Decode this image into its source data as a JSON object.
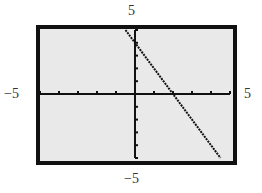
{
  "chart_data": {
    "type": "line",
    "title": "",
    "xlabel": "",
    "ylabel": "",
    "xlim": [
      -5,
      5
    ],
    "ylim": [
      -5,
      5
    ],
    "xscl": 1,
    "yscl": 1,
    "grid": false,
    "window_labels": {
      "ymax": "5",
      "ymin": "−5",
      "xmin": "−5",
      "xmax": "5"
    },
    "series": [
      {
        "name": "y = -2x + 4",
        "x": [
          -0.5,
          0,
          2,
          4.5
        ],
        "y": [
          5,
          4,
          0,
          -5
        ]
      }
    ],
    "x_intercept": 2,
    "y_intercept": 4
  },
  "colors": {
    "frame": "#111111",
    "screen": "#e9e9e9",
    "plot": "#111111",
    "label": "#333333"
  }
}
